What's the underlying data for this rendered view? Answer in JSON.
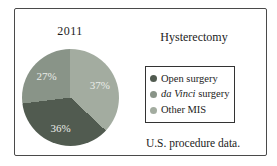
{
  "figure": {
    "year_label": "2011",
    "condition_title": "Hysterectomy",
    "caption": "U.S. procedure data."
  },
  "chart_data": {
    "type": "pie",
    "title": "2011",
    "subtitle": "Hysterectomy",
    "caption": "U.S. procedure data.",
    "start_angle_deg": 0,
    "direction": "clockwise",
    "slices": [
      {
        "label": "Other MIS",
        "value": 37,
        "display": "37%",
        "color": "#a3aca0"
      },
      {
        "label": "Open surgery",
        "value": 36,
        "display": "36%",
        "color": "#515b50"
      },
      {
        "label": "da Vinci surgery",
        "value": 27,
        "display": "27%",
        "color": "#899488"
      }
    ],
    "slice_label_color": "#eaede8",
    "legend_position": "right",
    "legend_title": "Hysterectomy"
  },
  "legend": {
    "items": [
      {
        "em": "",
        "text": "Open surgery",
        "color": "#515b50"
      },
      {
        "em": "da Vinci",
        "text": " surgery",
        "color": "#899488"
      },
      {
        "em": "",
        "text": "Other MIS",
        "color": "#a3aca0"
      }
    ]
  }
}
